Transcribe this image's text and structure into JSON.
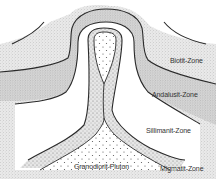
{
  "figure": {
    "type": "geological cross-section"
  },
  "labels": {
    "biotit": "Biotit-Zone",
    "andalusit": "Andalusit-Zone",
    "sillimanit": "Sillimanit-Zone",
    "pluton": "Granodiorit-Pluton",
    "migmatit": "Migmatit-Zone"
  },
  "colors": {
    "line": "#2a2a2a",
    "stipple_dense": "#9a9a9a",
    "stipple_light": "#c4c4c4",
    "pluton_dots": "#4a4a4a",
    "background": "#ffffff"
  }
}
